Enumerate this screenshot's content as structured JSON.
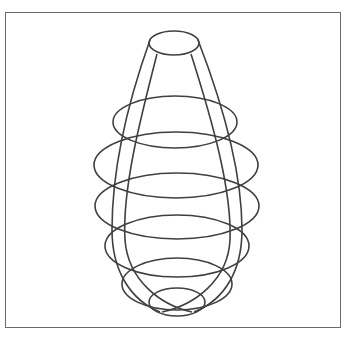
{
  "figure": {
    "stroke_color": "#404040",
    "frame_color": "#6a6a6a",
    "background": "#ffffff",
    "caption": ""
  },
  "wireframe": {
    "rings": [
      {
        "name": "top-ring",
        "cx": 174,
        "cy": 43,
        "rx": 25,
        "ry": 12
      },
      {
        "name": "ring-2",
        "cx": 175,
        "cy": 122,
        "rx": 62,
        "ry": 26
      },
      {
        "name": "ring-3",
        "cx": 176,
        "cy": 165,
        "rx": 82,
        "ry": 33
      },
      {
        "name": "ring-4",
        "cx": 177,
        "cy": 206,
        "rx": 82,
        "ry": 33
      },
      {
        "name": "ring-5",
        "cx": 177,
        "cy": 246,
        "rx": 72,
        "ry": 31
      },
      {
        "name": "ring-6",
        "cx": 177,
        "cy": 284,
        "rx": 55,
        "ry": 26
      },
      {
        "name": "bottom-ring",
        "cx": 177,
        "cy": 302,
        "rx": 28,
        "ry": 14
      }
    ],
    "meridians": [
      {
        "name": "meridian-far-left",
        "d": "M 150 40 C 125 110, 112 175, 112 230 C 112 270, 130 300, 160 312"
      },
      {
        "name": "meridian-near-left",
        "d": "M 157 54 C 140 120, 122 190, 125 240 C 128 280, 160 305, 192 312"
      },
      {
        "name": "meridian-near-right",
        "d": "M 191 54 C 212 120, 232 190, 230 240 C 228 280, 195 305, 162 312"
      },
      {
        "name": "meridian-far-right",
        "d": "M 198 40 C 225 110, 242 175, 242 230 C 242 270, 225 300, 194 312"
      }
    ]
  }
}
